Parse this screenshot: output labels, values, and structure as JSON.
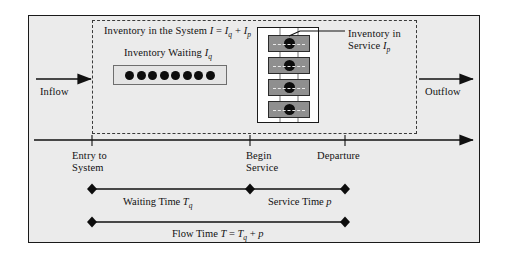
{
  "figure": {
    "background_color": "#ebebeb",
    "frame_color": "#1a1a1a"
  },
  "system": {
    "boundary_style": "dashed",
    "title_prefix": "Inventory in the System ",
    "title_symbol": "I",
    "title_equals": " = ",
    "title_term1": "I",
    "title_term1_sub": "q",
    "title_plus": " + ",
    "title_term2": "I",
    "title_term2_sub": "p"
  },
  "queue": {
    "label_text": "Inventory Waiting ",
    "label_symbol": "I",
    "label_sub": "q",
    "dot_count": 8,
    "dot_color": "#0d0d0d",
    "box_fill": "#e4e4e4"
  },
  "service": {
    "label_line1": "Inventory in",
    "label_line2_text": "Service ",
    "label_line2_symbol": "I",
    "label_line2_sub": "p",
    "server_count": 4,
    "server_fill": "#8f8f8f",
    "core_color": "#0d0d0d"
  },
  "flows": {
    "inflow_label": "Inflow",
    "outflow_label": "Outflow"
  },
  "timeline": {
    "milestones": [
      {
        "name": "entry",
        "line1": "Entry to",
        "line2": "System",
        "x": 92
      },
      {
        "name": "begin-service",
        "line1": "Begin",
        "line2": "Service",
        "x": 250
      },
      {
        "name": "departure",
        "line1": "Departure",
        "line2": "",
        "x": 345
      }
    ],
    "bars": [
      {
        "name": "waiting-time",
        "label_text": "Waiting Time ",
        "label_symbol": "T",
        "label_sub": "q",
        "x_start": 92,
        "x_end": 250
      },
      {
        "name": "service-time",
        "label_text": "Service Time ",
        "label_symbol": "p",
        "label_sub": "",
        "x_start": 250,
        "x_end": 345
      },
      {
        "name": "flow-time",
        "label_text": "Flow Time ",
        "label_symbol": "T",
        "label_equals": " = ",
        "label_term1": "T",
        "label_term1_sub": "q",
        "label_plus": " + ",
        "label_term2": "p",
        "x_start": 92,
        "x_end": 345
      }
    ]
  }
}
